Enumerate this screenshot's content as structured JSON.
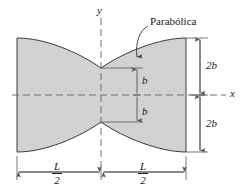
{
  "figure": {
    "background_color": "#ffffff",
    "body_fill_color": "#d2d2d2",
    "outline_color": "#3a3a3a",
    "dimension_color": "#555555",
    "axis_color": "#6e6e6e",
    "text_color": "#1a1a1a"
  },
  "annotations": {
    "curve_note": "Parabólica",
    "y_axis_label": "y",
    "x_axis_label": "x",
    "half_depth_upper": "b",
    "half_depth_lower": "b",
    "end_depth_upper": "2b",
    "end_depth_lower": "2b",
    "length_left_numerator": "L",
    "length_left_denominator": "2",
    "length_right_numerator": "L",
    "length_right_denominator": "2"
  },
  "geometry": {
    "left_edge_x": 17,
    "right_edge_x": 186,
    "center_x": 101,
    "axis_y": 95,
    "top_end_y": 38,
    "bottom_end_y": 152,
    "waist_top_y": 68,
    "waist_bottom_y": 122,
    "b_dimension_line_x": 137,
    "end_dimension_line_x": 200,
    "length_dimension_line_y": 172
  }
}
